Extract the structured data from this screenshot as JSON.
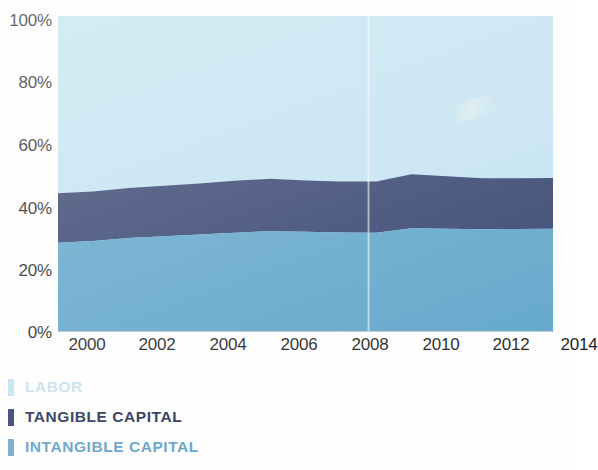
{
  "chart_data": {
    "type": "area",
    "title": "",
    "subtitle": "",
    "xlabel": "",
    "ylabel": "",
    "stacked": true,
    "normalized": true,
    "grid": false,
    "legend_position": "below-left",
    "xlim": [
      2000,
      2014
    ],
    "ylim": [
      0,
      100
    ],
    "x_tick_labels": [
      "2000",
      "2002",
      "2004",
      "2006",
      "2008",
      "2010",
      "2012",
      "2014"
    ],
    "x_tick_values": [
      2000,
      2002,
      2004,
      2006,
      2008,
      2010,
      2012,
      2014
    ],
    "y_tick_labels": [
      "0%",
      "20%",
      "40%",
      "60%",
      "80%",
      "100%"
    ],
    "y_tick_values": [
      0,
      20,
      40,
      60,
      80,
      100
    ],
    "x": [
      2000,
      2001,
      2002,
      2003,
      2004,
      2005,
      2006,
      2007,
      2008,
      2009,
      2010,
      2011,
      2012,
      2013,
      2014
    ],
    "series": [
      {
        "name": "INTANGIBLE CAPITAL",
        "color": "#5ba3c9",
        "stack_order": 1,
        "values": [
          28.0,
          28.6,
          29.5,
          30.1,
          30.6,
          31.2,
          31.7,
          31.5,
          31.3,
          31.2,
          32.6,
          32.5,
          32.3,
          32.4,
          32.5
        ]
      },
      {
        "name": "TANGIBLE CAPITAL",
        "color": "#2e3d6b",
        "stack_order": 2,
        "values": [
          15.7,
          15.7,
          15.9,
          16.0,
          16.2,
          16.5,
          16.6,
          16.3,
          16.2,
          16.3,
          17.2,
          16.6,
          16.2,
          16.1,
          16.1
        ]
      },
      {
        "name": "LABOR",
        "color": "#c2e3f2",
        "stack_order": 3,
        "values": [
          56.3,
          55.7,
          54.6,
          53.9,
          53.2,
          52.3,
          51.7,
          52.2,
          52.5,
          52.5,
          50.2,
          50.9,
          51.5,
          51.5,
          51.4
        ]
      }
    ],
    "cumulative_boundaries": {
      "intangible_top": [
        28.0,
        28.6,
        29.5,
        30.1,
        30.6,
        31.2,
        31.7,
        31.5,
        31.3,
        31.2,
        32.6,
        32.5,
        32.3,
        32.4,
        32.5
      ],
      "tangible_top": [
        43.7,
        44.3,
        45.4,
        46.1,
        46.8,
        47.7,
        48.3,
        47.8,
        47.5,
        47.5,
        49.8,
        49.1,
        48.5,
        48.5,
        48.6
      ]
    }
  },
  "legend": {
    "items": [
      {
        "label": "LABOR",
        "color": "#c2e3f2",
        "text_color": "#c8dfec"
      },
      {
        "label": "TANGIBLE CAPITAL",
        "color": "#2e3d6b",
        "text_color": "#232f52"
      },
      {
        "label": "INTANGIBLE CAPITAL",
        "color": "#6aa8cc",
        "text_color": "#5e9fc6"
      }
    ]
  },
  "colors": {
    "labor": "#c2e3f2",
    "tangible_capital": "#2e3d6b",
    "intangible_capital": "#5ba3c9",
    "axis_text": "#1b1b1b",
    "background": "#ffffff"
  }
}
